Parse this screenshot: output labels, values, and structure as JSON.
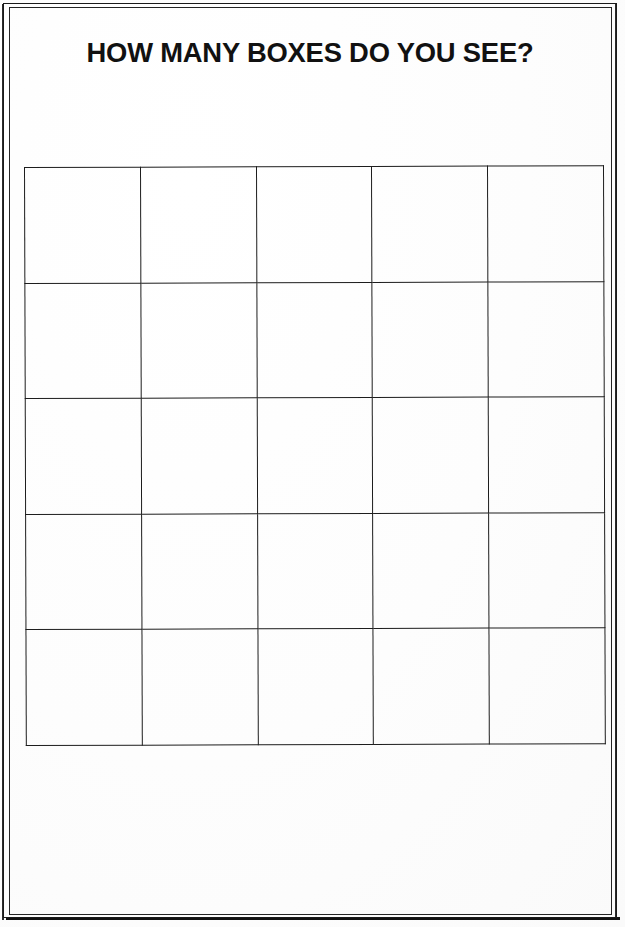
{
  "document": {
    "title": "HOW MANY BOXES DO YOU SEE?",
    "background_color": "#ffffff",
    "ink_color": "#1a1a1a"
  },
  "frame": {
    "style": "double-line-border",
    "outer_color": "#1a1a1a",
    "inner_color": "#242424"
  },
  "grid": {
    "rows": 5,
    "columns": 5,
    "total_boxes": 25,
    "line_color": "#1d1d1d",
    "cells": [
      [
        "",
        "",
        "",
        "",
        ""
      ],
      [
        "",
        "",
        "",
        "",
        ""
      ],
      [
        "",
        "",
        "",
        "",
        ""
      ],
      [
        "",
        "",
        "",
        "",
        ""
      ],
      [
        "",
        "",
        "",
        "",
        ""
      ]
    ]
  }
}
